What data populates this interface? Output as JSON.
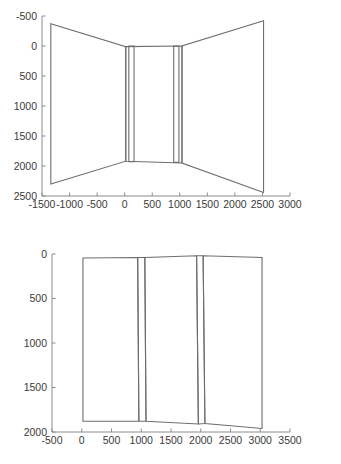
{
  "page": {
    "background_color": "#ffffff",
    "line_color": "#6e6e6e",
    "axis_color": "#8c8c8c",
    "label_color": "#3a3a3a"
  },
  "chart_data": [
    {
      "id": "top-plot",
      "type": "line",
      "title": "",
      "xlabel": "",
      "ylabel": "",
      "xlim": [
        -1500,
        3000
      ],
      "ylim": [
        -500,
        2500
      ],
      "y_inverted": true,
      "grid": false,
      "legend": null,
      "xticks": [
        -1500,
        -1000,
        -500,
        0,
        500,
        1000,
        1500,
        2000,
        2500,
        3000
      ],
      "xtick_labels": [
        "-1500",
        "-1000",
        "-500",
        "0",
        "500",
        "1000",
        "1500",
        "2000",
        "2500",
        "3000"
      ],
      "yticks": [
        -500,
        0,
        500,
        1000,
        1500,
        2000,
        2500
      ],
      "ytick_labels": [
        "-500",
        "0",
        "500",
        "1000",
        "1500",
        "2000",
        "2500"
      ],
      "series": [
        {
          "name": "left-wall-outline",
          "closed": true,
          "x": [
            -1340,
            -1340,
            20,
            20
          ],
          "y": [
            -370,
            2300,
            1920,
            10
          ]
        },
        {
          "name": "right-wall-outline",
          "closed": true,
          "x": [
            2520,
            2520,
            1040,
            1040
          ],
          "y": [
            -420,
            2440,
            1950,
            0
          ]
        },
        {
          "name": "center-panel-outline",
          "closed": true,
          "x": [
            20,
            20,
            1040,
            1040
          ],
          "y": [
            10,
            1920,
            1950,
            0
          ]
        },
        {
          "name": "left-inner-column",
          "closed": true,
          "x": [
            75,
            75,
            170,
            170
          ],
          "y": [
            0,
            1930,
            1930,
            0
          ]
        },
        {
          "name": "right-inner-column",
          "closed": true,
          "x": [
            890,
            890,
            985,
            985
          ],
          "y": [
            0,
            1940,
            1940,
            0
          ]
        }
      ]
    },
    {
      "id": "bottom-plot",
      "type": "line",
      "title": "",
      "xlabel": "",
      "ylabel": "",
      "xlim": [
        -500,
        3500
      ],
      "ylim": [
        0,
        2000
      ],
      "y_inverted": true,
      "grid": false,
      "legend": null,
      "xticks": [
        -500,
        0,
        500,
        1000,
        1500,
        2000,
        2500,
        3000,
        3500
      ],
      "xtick_labels": [
        "-500",
        "0",
        "500",
        "1000",
        "1500",
        "2000",
        "2500",
        "3000",
        "3500"
      ],
      "yticks": [
        0,
        500,
        1000,
        1500,
        2000
      ],
      "ytick_labels": [
        "0",
        "500",
        "1000",
        "1500",
        "2000"
      ],
      "series": [
        {
          "name": "left-bay-outline",
          "closed": true,
          "x": [
            20,
            20,
            960,
            940
          ],
          "y": [
            45,
            1880,
            1880,
            40
          ]
        },
        {
          "name": "mid-bay-outline",
          "closed": true,
          "x": [
            1060,
            1080,
            1960,
            1930
          ],
          "y": [
            40,
            1880,
            1910,
            20
          ]
        },
        {
          "name": "right-bay-outline",
          "closed": true,
          "x": [
            2040,
            2070,
            3030,
            3030
          ],
          "y": [
            20,
            1905,
            1960,
            40
          ]
        },
        {
          "name": "left-inner-column",
          "closed": true,
          "x": [
            940,
            960,
            1080,
            1060
          ],
          "y": [
            40,
            1880,
            1880,
            40
          ]
        },
        {
          "name": "right-inner-column",
          "closed": true,
          "x": [
            1930,
            1960,
            2070,
            2040
          ],
          "y": [
            20,
            1910,
            1905,
            20
          ]
        }
      ]
    }
  ]
}
